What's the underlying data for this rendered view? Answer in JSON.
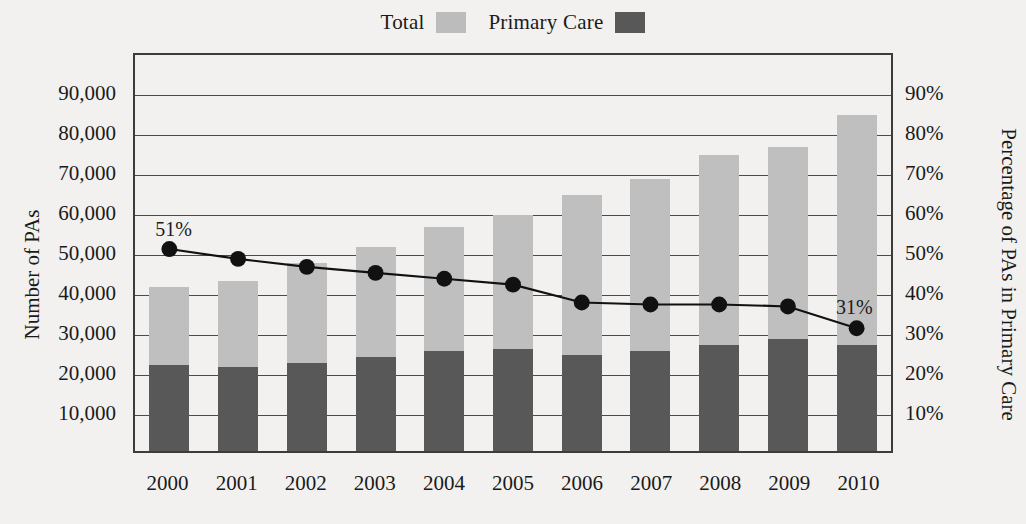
{
  "legend": {
    "entries": [
      {
        "label": "Total",
        "swatch": "total",
        "color": "#bfbfbf"
      },
      {
        "label": "Primary Care",
        "swatch": "primary",
        "color": "#585858"
      }
    ]
  },
  "axes": {
    "left_title": "Number of PAs",
    "right_title": "Percentage of PAs in Primary Care",
    "left_ticks": [
      "10,000",
      "20,000",
      "30,000",
      "40,000",
      "50,000",
      "60,000",
      "70,000",
      "80,000",
      "90,000"
    ],
    "right_ticks": [
      "10%",
      "20%",
      "30%",
      "40%",
      "50%",
      "60%",
      "70%",
      "80%",
      "90%"
    ]
  },
  "annotations": {
    "first_label": "51%",
    "last_label": "31%"
  },
  "chart_data": {
    "type": "bar",
    "title": "",
    "subtitle": "",
    "xlabel": "",
    "ylabel": "Number of PAs",
    "y2label": "Percentage of PAs in Primary Care",
    "categories": [
      "2000",
      "2001",
      "2002",
      "2003",
      "2004",
      "2005",
      "2006",
      "2007",
      "2008",
      "2009",
      "2010"
    ],
    "ylim": [
      0,
      100000
    ],
    "y2lim": [
      0,
      100
    ],
    "grid": true,
    "legend_position": "top-center",
    "stacked": true,
    "series": [
      {
        "name": "Total",
        "type": "bar",
        "color": "#bfbfbf",
        "axis": "left",
        "values": [
          41000,
          42500,
          47000,
          51000,
          56000,
          59000,
          64000,
          68000,
          74000,
          76000,
          84000
        ]
      },
      {
        "name": "Primary Care",
        "type": "bar",
        "color": "#585858",
        "axis": "left",
        "values": [
          21500,
          21000,
          22000,
          23500,
          25000,
          25500,
          24000,
          25000,
          26500,
          28000,
          26500
        ]
      },
      {
        "name": "Percentage of PAs in Primary Care",
        "type": "line",
        "color": "#111111",
        "axis": "right",
        "values": [
          51,
          48.5,
          46.5,
          45,
          43.5,
          42,
          37.5,
          37,
          37,
          36.5,
          31
        ],
        "point_labels": [
          "51%",
          "",
          "",
          "",
          "",
          "",
          "",
          "",
          "",
          "",
          "31%"
        ]
      }
    ]
  }
}
